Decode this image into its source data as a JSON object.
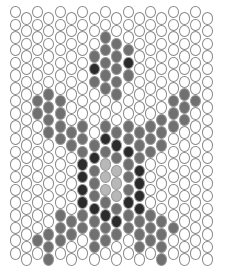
{
  "grid": {
    "columns": 18,
    "rows": 20,
    "origin_x": 9.5,
    "origin_y": 9,
    "col_pitch": 11.3,
    "row_pitch": 12.7,
    "odd_column_offset": 6.35
  },
  "palette": {
    "0": "#ffffff",
    "1": "#707070",
    "2": "#2b2b2b",
    "3": "#b8b8b8"
  },
  "pattern": [
    "000000000000000000",
    "000000000000000000",
    "000000001100000000",
    "000000011110000000",
    "000000021120000000",
    "000000011110000000",
    "000100001100000100",
    "001110000000001110",
    "001110000000011100",
    "000111101111111000",
    "000011112211110000",
    "000000121121100000",
    "000000213312000000",
    "000000213312000000",
    "000000213312000000",
    "000000221122000000",
    "000011112211110000",
    "000111111111111000",
    "001110011001110000",
    "000100000000010000"
  ]
}
